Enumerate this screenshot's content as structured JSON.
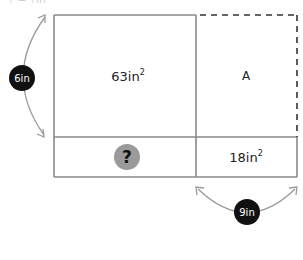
{
  "figure": {
    "cropped_title": "? = ?in²",
    "regions": {
      "top_left": {
        "label": "63in",
        "unit_sup": "2"
      },
      "top_right": {
        "label": "A"
      },
      "bottom_left": {
        "label": "?"
      },
      "bottom_right": {
        "label": "18in",
        "unit_sup": "2"
      }
    },
    "dimensions": {
      "height": {
        "label": "6in"
      },
      "width": {
        "label": "9in"
      }
    },
    "colors": {
      "line": "#8a8a8a",
      "arrow": "#9a9a9a",
      "badge_fill": "#111111",
      "badge_text": "#ffffff",
      "question_fill": "#9a9a9a",
      "dashed_line": "#333333"
    }
  }
}
